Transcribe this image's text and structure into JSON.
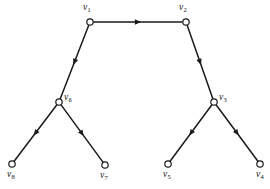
{
  "figure": {
    "kind": "directed-graph",
    "background_color": "#ffffff",
    "line_color": "#1a1a1a",
    "node_fill_color": "#ffffff",
    "width": 270,
    "height": 189
  },
  "nodes": [
    {
      "id": "v1",
      "letter": "v",
      "subscript": "1",
      "label": "v1",
      "x": 90,
      "y": 22,
      "label_x": 83,
      "label_y": 3,
      "radius": 3.2
    },
    {
      "id": "v2",
      "letter": "v",
      "subscript": "2",
      "label": "v2",
      "x": 186,
      "y": 22,
      "label_x": 179,
      "label_y": 3,
      "radius": 3.2
    },
    {
      "id": "v3",
      "letter": "v",
      "subscript": "3",
      "label": "v3",
      "x": 214,
      "y": 102,
      "label_x": 219,
      "label_y": 93,
      "radius": 3.2
    },
    {
      "id": "v4",
      "letter": "v",
      "subscript": "4",
      "label": "v4",
      "x": 260,
      "y": 164,
      "label_x": 256,
      "label_y": 170,
      "radius": 3.2
    },
    {
      "id": "v5",
      "letter": "v",
      "subscript": "5",
      "label": "v5",
      "x": 168,
      "y": 164,
      "label_x": 163,
      "label_y": 170,
      "radius": 3.2
    },
    {
      "id": "v6",
      "letter": "v",
      "subscript": "6",
      "label": "v6",
      "x": 59,
      "y": 102,
      "label_x": 64,
      "label_y": 93,
      "radius": 3.2
    },
    {
      "id": "v7",
      "letter": "v",
      "subscript": "7",
      "label": "v7",
      "x": 105,
      "y": 165,
      "label_x": 100,
      "label_y": 171,
      "radius": 3.2
    },
    {
      "id": "v8",
      "letter": "v",
      "subscript": "8",
      "label": "v8",
      "x": 12,
      "y": 164,
      "label_x": 7,
      "label_y": 170,
      "radius": 3.2
    }
  ],
  "edges": [
    {
      "id": "e-v1-v2",
      "from": "v1",
      "to": "v2",
      "arrow_at": 0.5,
      "direction": "right"
    },
    {
      "id": "e-v1-v6",
      "from": "v1",
      "to": "v6",
      "arrow_at": 0.5,
      "direction": "down-left"
    },
    {
      "id": "e-v2-v3",
      "from": "v2",
      "to": "v3",
      "arrow_at": 0.5,
      "direction": "down-right"
    },
    {
      "id": "e-v6-v8",
      "from": "v6",
      "to": "v8",
      "arrow_at": 0.5,
      "direction": "down-left"
    },
    {
      "id": "e-v6-v7",
      "from": "v6",
      "to": "v7",
      "arrow_at": 0.5,
      "direction": "down-right"
    },
    {
      "id": "e-v3-v5",
      "from": "v3",
      "to": "v5",
      "arrow_at": 0.5,
      "direction": "down-left"
    },
    {
      "id": "e-v3-v4",
      "from": "v3",
      "to": "v4",
      "arrow_at": 0.5,
      "direction": "down-right"
    }
  ]
}
